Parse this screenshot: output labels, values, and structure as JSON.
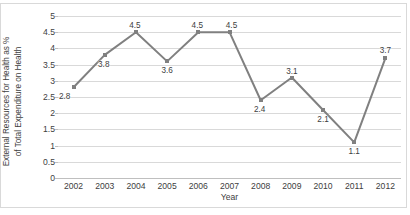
{
  "chart_data": {
    "type": "line",
    "title": "",
    "xlabel": "Year",
    "ylabel": "External Resources for Health as % of Total Expenditure on Health",
    "ylabel_line1": "External Resources for Health as %",
    "ylabel_line2": "of Total Expenditure on Health",
    "categories": [
      "2002",
      "2003",
      "2004",
      "2005",
      "2006",
      "2007",
      "2008",
      "2009",
      "2010",
      "2011",
      "2012"
    ],
    "values": [
      2.8,
      3.8,
      4.5,
      3.6,
      4.5,
      4.5,
      2.4,
      3.1,
      2.1,
      1.1,
      3.7
    ],
    "data_labels": [
      "2.8",
      "3.8",
      "4.5",
      "3.6",
      "4.5",
      "4.5",
      "2.4",
      "3.1",
      "2.1",
      "1.1",
      "3.7"
    ],
    "ylim": [
      0,
      5
    ],
    "ytick_values": [
      5,
      4.5,
      4,
      3.5,
      3,
      2.5,
      2,
      1.5,
      1,
      0.5,
      0
    ],
    "ytick_labels": [
      "5",
      "4.5",
      "4",
      "3.5",
      "3",
      "2.5",
      "2",
      "1.5",
      "1",
      "0.5",
      "0"
    ],
    "grid": true,
    "legend": false,
    "series_color": "#808080",
    "grid_color": "#D9D9D9",
    "text_color": "#404040",
    "border_color": "#D9D9D9",
    "background": "#FFFFFF"
  }
}
